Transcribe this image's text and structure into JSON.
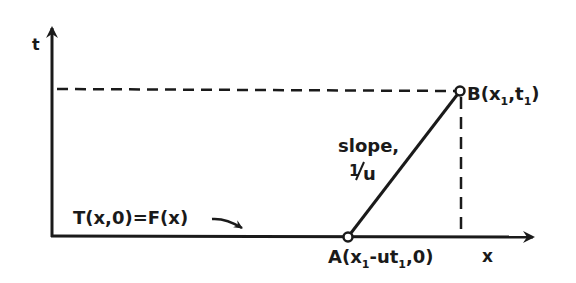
{
  "diagram": {
    "type": "characteristic line in x-t plane",
    "axes": {
      "vertical_label": "t",
      "horizontal_label": "x"
    },
    "points": {
      "A": {
        "label": "A(x",
        "sub1": "1",
        "mid": "-ut",
        "sub2": "1",
        "end": ",0)"
      },
      "B": {
        "label": "B(x",
        "sub1": "1",
        "mid": ",t",
        "sub2": "1",
        "end": ")"
      }
    },
    "slope_annotation": {
      "line1": "slope,",
      "line2_num": "1",
      "line2_den": "u"
    },
    "initial_condition": "T(x,0)=F(x)",
    "colors": {
      "ink": "#1a1a1a",
      "background": "#ffffff"
    }
  }
}
